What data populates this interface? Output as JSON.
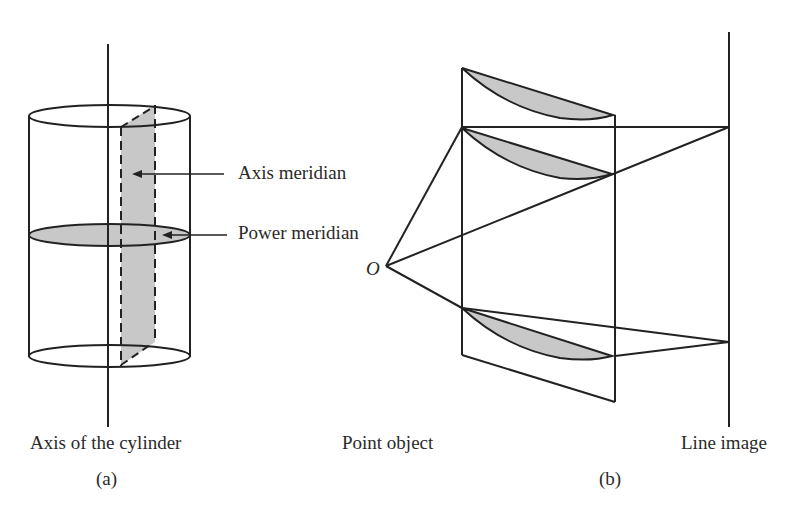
{
  "figure": {
    "panel_a": {
      "caption": "(a)",
      "labels": {
        "axis_meridian": "Axis meridian",
        "power_meridian": "Power meridian",
        "axis_of_cylinder": "Axis of the cylinder"
      }
    },
    "panel_b": {
      "caption": "(b)",
      "labels": {
        "origin": "O",
        "point_object": "Point object",
        "line_image": "Line image"
      }
    },
    "colors": {
      "stroke": "#222222",
      "shade": "#c8c8c8",
      "background": "#ffffff"
    }
  }
}
